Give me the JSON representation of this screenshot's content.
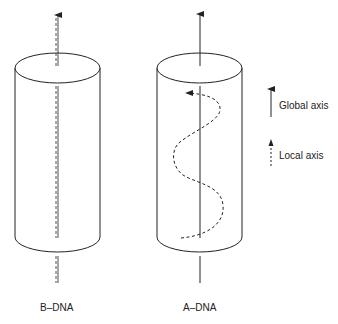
{
  "figure": {
    "panels": [
      {
        "id": "b-dna",
        "label": "B–DNA",
        "axis_style": "local axis coincides with global axis (dashed over solid)"
      },
      {
        "id": "a-dna",
        "label": "A–DNA",
        "axis_style": "local axis is a helix wrapping around the global axis"
      }
    ],
    "legend": [
      {
        "label": "Global axis",
        "style": "solid arrow"
      },
      {
        "label": "Local axis",
        "style": "dashed arrow"
      }
    ],
    "colors": {
      "stroke": "#222222",
      "background": "#ffffff"
    }
  }
}
